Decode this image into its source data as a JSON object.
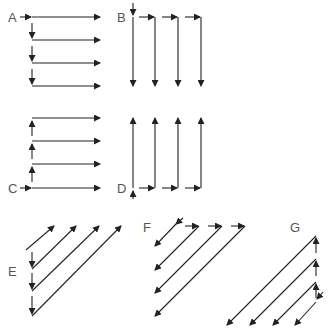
{
  "colors": {
    "line": "#222222",
    "label": "#555555",
    "background": "#ffffff"
  },
  "labels": [
    {
      "id": "A",
      "text": "A",
      "x": 8,
      "y": 22
    },
    {
      "id": "B",
      "text": "B",
      "x": 117,
      "y": 22
    },
    {
      "id": "C",
      "text": "C",
      "x": 8,
      "y": 193
    },
    {
      "id": "D",
      "text": "D",
      "x": 117,
      "y": 193
    },
    {
      "id": "E",
      "text": "E",
      "x": 8,
      "y": 276
    },
    {
      "id": "F",
      "text": "F",
      "x": 143,
      "y": 232
    },
    {
      "id": "G",
      "text": "G",
      "x": 290,
      "y": 232
    }
  ],
  "patterns": {
    "A": {
      "description": "Row-wise left-to-right, moving down",
      "arrows": [
        [
          20,
          17,
          31,
          17
        ],
        [
          32,
          17,
          100,
          17
        ],
        [
          32,
          40,
          100,
          40
        ],
        [
          32,
          63,
          100,
          63
        ],
        [
          32,
          86,
          100,
          86
        ],
        [
          32,
          23,
          32,
          38
        ],
        [
          32,
          46,
          32,
          61
        ],
        [
          32,
          69,
          32,
          84
        ]
      ]
    },
    "B": {
      "description": "Column-wise top-to-bottom, moving right",
      "arrows": [
        [
          133,
          3,
          133,
          15
        ],
        [
          133,
          17,
          133,
          86
        ],
        [
          155,
          17,
          155,
          86
        ],
        [
          178,
          17,
          178,
          86
        ],
        [
          201,
          17,
          201,
          86
        ],
        [
          139,
          17,
          154,
          17
        ],
        [
          162,
          17,
          177,
          17
        ],
        [
          185,
          17,
          200,
          17
        ]
      ]
    },
    "C": {
      "description": "Row-wise left-to-right, moving up",
      "arrows": [
        [
          20,
          188,
          31,
          188
        ],
        [
          32,
          188,
          100,
          188
        ],
        [
          32,
          164,
          100,
          164
        ],
        [
          32,
          141,
          100,
          141
        ],
        [
          32,
          118,
          100,
          118
        ],
        [
          32,
          182,
          32,
          167
        ],
        [
          32,
          159,
          32,
          144
        ],
        [
          32,
          136,
          32,
          121
        ]
      ]
    },
    "D": {
      "description": "Column-wise bottom-to-top, moving right",
      "arrows": [
        [
          133,
          199,
          133,
          191
        ],
        [
          133,
          188,
          133,
          118
        ],
        [
          155,
          188,
          155,
          118
        ],
        [
          178,
          188,
          178,
          118
        ],
        [
          201,
          188,
          201,
          118
        ],
        [
          139,
          188,
          154,
          188
        ],
        [
          162,
          188,
          177,
          188
        ],
        [
          185,
          188,
          200,
          188
        ]
      ]
    },
    "E": {
      "description": "Diagonal bottom-left to top-right, moving down",
      "arrows": [
        [
          26,
          250,
          54,
          226
        ],
        [
          32,
          269,
          76,
          226
        ],
        [
          32,
          291,
          99,
          226
        ],
        [
          32,
          316,
          121,
          226
        ],
        [
          32,
          252,
          32,
          267
        ],
        [
          32,
          273,
          32,
          289
        ],
        [
          32,
          296,
          32,
          314
        ]
      ]
    },
    "F": {
      "description": "Diagonal top-right to bottom-left, moving right",
      "arrows": [
        [
          183,
          218,
          176,
          224
        ],
        [
          176,
          224,
          155,
          246
        ],
        [
          199,
          226,
          155,
          270
        ],
        [
          222,
          226,
          155,
          293
        ],
        [
          245,
          226,
          155,
          316
        ],
        [
          185,
          226,
          198,
          226
        ],
        [
          208,
          226,
          221,
          226
        ],
        [
          231,
          226,
          244,
          226
        ]
      ]
    },
    "G": {
      "description": "Diagonal top-right to bottom-left, moving up",
      "arrows": [
        [
          323,
          292,
          317,
          299
        ],
        [
          316,
          302,
          295,
          325
        ],
        [
          316,
          282,
          273,
          325
        ],
        [
          316,
          259,
          250,
          325
        ],
        [
          316,
          236,
          227,
          325
        ],
        [
          316,
          298,
          316,
          284
        ],
        [
          316,
          276,
          316,
          261
        ],
        [
          316,
          253,
          316,
          238
        ]
      ]
    }
  }
}
